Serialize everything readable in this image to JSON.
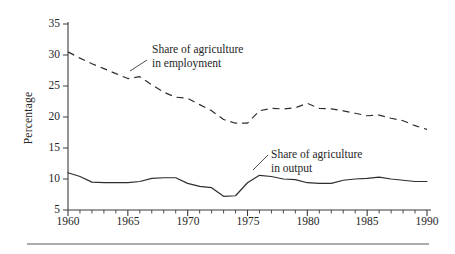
{
  "figure": {
    "background_color": "#ffffff",
    "ink_color": "#262626"
  },
  "chart_data": {
    "type": "line",
    "title": "",
    "xlabel": "",
    "ylabel": "Percentage",
    "xlim": [
      1960,
      1990
    ],
    "ylim": [
      5,
      35
    ],
    "ytick_labels": [
      "35",
      "30",
      "25",
      "20",
      "15",
      "10",
      "5"
    ],
    "yticks": [
      35,
      30,
      25,
      20,
      15,
      10,
      5
    ],
    "xtick_labels": [
      "1960",
      "1965",
      "1970",
      "1975",
      "1980",
      "1985",
      "1990"
    ],
    "xticks": [
      1960,
      1965,
      1970,
      1975,
      1980,
      1985,
      1990
    ],
    "minor_xticks_interval": 1,
    "grid": false,
    "legend": "inline-annotations",
    "x": [
      1960,
      1961,
      1962,
      1963,
      1964,
      1965,
      1966,
      1967,
      1968,
      1969,
      1970,
      1971,
      1972,
      1973,
      1974,
      1975,
      1976,
      1977,
      1978,
      1979,
      1980,
      1981,
      1982,
      1983,
      1984,
      1985,
      1986,
      1987,
      1988,
      1989,
      1990
    ],
    "series": [
      {
        "name": "Share of agriculture in employment",
        "style": "dashed",
        "values": [
          30.5,
          29.5,
          28.6,
          27.8,
          27.0,
          26.2,
          26.5,
          25.2,
          24.0,
          23.2,
          23.0,
          22.0,
          21.0,
          19.6,
          19.0,
          19.0,
          21.0,
          21.4,
          21.3,
          21.5,
          22.2,
          21.4,
          21.3,
          21.0,
          20.6,
          20.2,
          20.3,
          19.8,
          19.4,
          18.6,
          18.0
        ]
      },
      {
        "name": "Share of agriculture in output",
        "style": "solid",
        "values": [
          11.0,
          10.4,
          9.5,
          9.4,
          9.4,
          9.4,
          9.6,
          10.1,
          10.2,
          10.2,
          9.3,
          8.8,
          8.6,
          7.2,
          7.3,
          9.4,
          10.6,
          10.4,
          10.0,
          9.9,
          9.4,
          9.3,
          9.3,
          9.8,
          10.0,
          10.1,
          10.3,
          10.0,
          9.8,
          9.6,
          9.6
        ]
      }
    ],
    "annotations": [
      {
        "id": "employment-label",
        "line1": "Share of agriculture",
        "line2": "in employment"
      },
      {
        "id": "output-label",
        "line1": "Share of agriculture",
        "line2": "in output"
      }
    ]
  }
}
